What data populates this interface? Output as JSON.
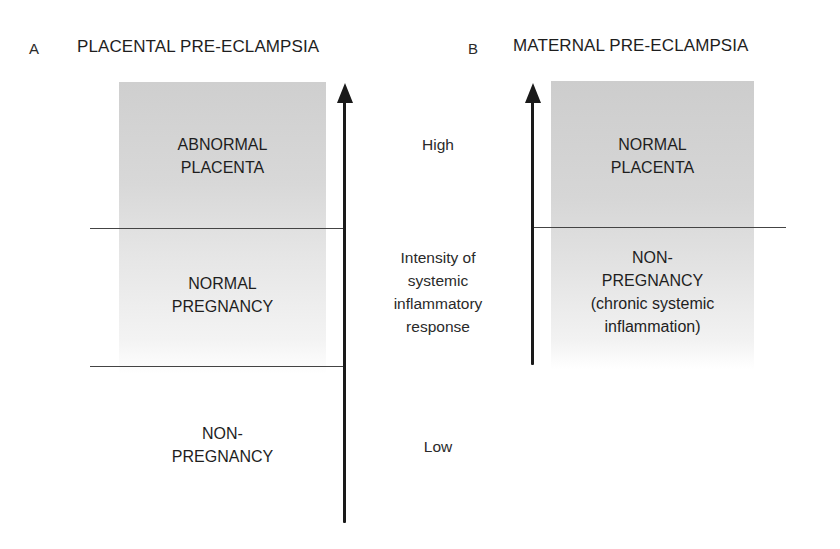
{
  "panels": {
    "a": {
      "letter": "A",
      "title": "PLACENTAL PRE-ECLAMPSIA",
      "regions": [
        {
          "line1": "ABNORMAL",
          "line2": "PLACENTA"
        },
        {
          "line1": "NORMAL",
          "line2": "PREGNANCY"
        },
        {
          "line1": "NON-",
          "line2": "PREGNANCY"
        }
      ]
    },
    "b": {
      "letter": "B",
      "title": "MATERNAL PRE-ECLAMPSIA",
      "regions": [
        {
          "line1": "NORMAL",
          "line2": "PLACENTA"
        },
        {
          "line1": "NON-",
          "line2": "PREGNANCY",
          "line3": "(chronic systemic",
          "line4": "inflammation)"
        }
      ]
    }
  },
  "axis": {
    "high": "High",
    "low": "Low",
    "label_lines": [
      "Intensity of",
      "systemic",
      "inflammatory",
      "response"
    ]
  },
  "colors": {
    "shading_top": "#cfcfcf",
    "shading_bottom": "#ffffff",
    "axis": "#1a1a1a",
    "divider": "#444444"
  }
}
